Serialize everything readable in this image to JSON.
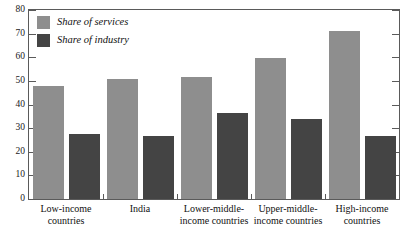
{
  "chart_data": {
    "type": "bar",
    "title": "",
    "subtitle": "",
    "xlabel": "",
    "ylabel": "",
    "ylim": [
      0,
      80
    ],
    "yticks": [
      0,
      10,
      20,
      30,
      40,
      50,
      60,
      70,
      80
    ],
    "grid": false,
    "legend_position": "top-left-inside",
    "categories": [
      "Low-income countries",
      "India",
      "Lower-middle-income countries",
      "Upper-middle-income countries",
      "High-income countries"
    ],
    "category_lines": [
      [
        "Low-income",
        "countries"
      ],
      [
        "India",
        ""
      ],
      [
        "Lower-middle-",
        "income countries"
      ],
      [
        "Upper-middle-",
        "income countries"
      ],
      [
        "High-income",
        "countries"
      ]
    ],
    "series": [
      {
        "name": "Share of services",
        "color": "#8e8e8e",
        "values": [
          48,
          51,
          51.5,
          59.5,
          71
        ]
      },
      {
        "name": "Share of industry",
        "color": "#444444",
        "values": [
          27.5,
          26.5,
          36.5,
          34,
          26.5
        ]
      }
    ]
  },
  "legend": {
    "items": [
      {
        "label": "Share of services",
        "color": "#8e8e8e"
      },
      {
        "label": "Share of industry",
        "color": "#444444"
      }
    ]
  },
  "axis": {
    "y_tick_labels": [
      "80",
      "70",
      "60",
      "50",
      "40",
      "30",
      "20",
      "10",
      "0"
    ]
  },
  "colors": {
    "services": "#8e8e8e",
    "industry": "#444444",
    "frame": "#5a5a5a",
    "text": "#111111",
    "background": "#ffffff"
  }
}
